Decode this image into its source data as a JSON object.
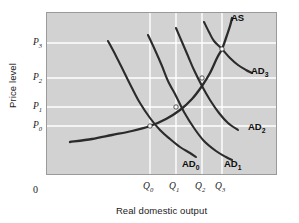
{
  "chart_data": {
    "type": "line",
    "title": "",
    "xlabel": "Real domestic output",
    "ylabel": "Price level",
    "origin_label": "0",
    "grid": true,
    "grid_color": "#ffffff",
    "panel_color": "#d2d2d2",
    "curve_color": "#2b2b2b",
    "ytick_labels": [
      "P0",
      "P1",
      "P2",
      "P3"
    ],
    "xtick_labels": [
      "Q0",
      "Q1",
      "Q2",
      "Q3"
    ],
    "yticks": [
      {
        "base": "P",
        "sub": "3",
        "y_px": 43
      },
      {
        "base": "P",
        "sub": "2",
        "y_px": 78
      },
      {
        "base": "P",
        "sub": "1",
        "y_px": 107
      },
      {
        "base": "P",
        "sub": "0",
        "y_px": 126
      }
    ],
    "xticks": [
      {
        "base": "Q",
        "sub": "0",
        "x_px": 150
      },
      {
        "base": "Q",
        "sub": "1",
        "x_px": 176
      },
      {
        "base": "Q",
        "sub": "2",
        "x_px": 202
      },
      {
        "base": "Q",
        "sub": "3",
        "x_px": 222
      }
    ],
    "series": [
      {
        "name": "AS",
        "label_base": "AS",
        "label_sub": "",
        "role": "aggregate-supply",
        "points": [
          [
            70,
            142
          ],
          [
            92,
            139
          ],
          [
            112,
            135
          ],
          [
            132,
            131
          ],
          [
            150,
            126
          ],
          [
            166,
            119
          ],
          [
            180,
            110
          ],
          [
            192,
            99
          ],
          [
            202,
            86
          ],
          [
            210,
            73
          ],
          [
            217,
            58
          ],
          [
            222,
            49
          ],
          [
            226,
            38
          ],
          [
            230,
            26
          ],
          [
            232,
            18
          ]
        ]
      },
      {
        "name": "AD0",
        "label_base": "AD",
        "label_sub": "0",
        "role": "aggregate-demand",
        "points": [
          [
            108,
            41
          ],
          [
            116,
            56
          ],
          [
            124,
            72
          ],
          [
            132,
            88
          ],
          [
            140,
            103
          ],
          [
            150,
            118
          ],
          [
            160,
            130
          ],
          [
            170,
            139
          ],
          [
            180,
            147
          ],
          [
            190,
            153
          ],
          [
            196,
            157
          ]
        ]
      },
      {
        "name": "AD1",
        "label_base": "AD",
        "label_sub": "1",
        "role": "aggregate-demand",
        "points": [
          [
            148,
            35
          ],
          [
            155,
            50
          ],
          [
            162,
            66
          ],
          [
            168,
            81
          ],
          [
            176,
            96
          ],
          [
            184,
            112
          ],
          [
            194,
            128
          ],
          [
            204,
            141
          ],
          [
            216,
            151
          ],
          [
            226,
            157
          ],
          [
            232,
            160
          ]
        ]
      },
      {
        "name": "AD2",
        "label_base": "AD",
        "label_sub": "2",
        "role": "aggregate-demand",
        "points": [
          [
            176,
            28
          ],
          [
            182,
            42
          ],
          [
            188,
            56
          ],
          [
            194,
            70
          ],
          [
            202,
            86
          ],
          [
            210,
            100
          ],
          [
            219,
            113
          ],
          [
            228,
            123
          ],
          [
            238,
            130
          ]
        ]
      },
      {
        "name": "AD3",
        "label_base": "AD",
        "label_sub": "3",
        "role": "aggregate-demand",
        "points": [
          [
            204,
            22
          ],
          [
            209,
            32
          ],
          [
            214,
            41
          ],
          [
            222,
            49
          ],
          [
            230,
            58
          ],
          [
            238,
            65
          ],
          [
            246,
            70
          ],
          [
            252,
            73
          ]
        ]
      }
    ],
    "equilibria": [
      {
        "name": "E0",
        "x_px": 150,
        "y_px": 126,
        "x_label": "Q0",
        "y_label": "P0"
      },
      {
        "name": "E1",
        "x_px": 176,
        "y_px": 107,
        "x_label": "Q1",
        "y_label": "P1"
      },
      {
        "name": "E2",
        "x_px": 202,
        "y_px": 78,
        "x_label": "Q2",
        "y_label": "P2"
      },
      {
        "name": "E3",
        "x_px": 222,
        "y_px": 49,
        "x_label": "Q3",
        "y_label": "P3"
      }
    ],
    "annotations": [
      {
        "text": "AS",
        "base": "AS",
        "sub": "",
        "x_px": 231,
        "y_px": 13
      },
      {
        "text": "AD3",
        "base": "AD",
        "sub": "3",
        "x_px": 251,
        "y_px": 66
      },
      {
        "text": "AD2",
        "base": "AD",
        "sub": "2",
        "x_px": 248,
        "y_px": 122
      },
      {
        "text": "AD1",
        "base": "AD",
        "sub": "1",
        "x_px": 224,
        "y_px": 159
      },
      {
        "text": "AD0",
        "base": "AD",
        "sub": "0",
        "x_px": 182,
        "y_px": 159
      }
    ]
  },
  "axes": {
    "y_title": "Price level",
    "x_title": "Real domestic output",
    "origin": "0"
  }
}
